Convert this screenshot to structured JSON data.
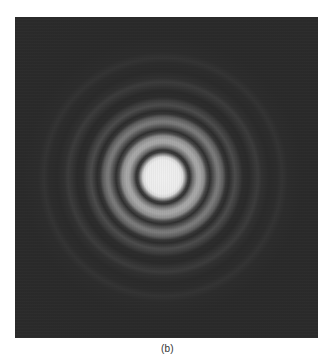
{
  "figure": {
    "background_color": "#2b2b2b",
    "center_color": "#f0f0f0",
    "caption": "(b)"
  }
}
